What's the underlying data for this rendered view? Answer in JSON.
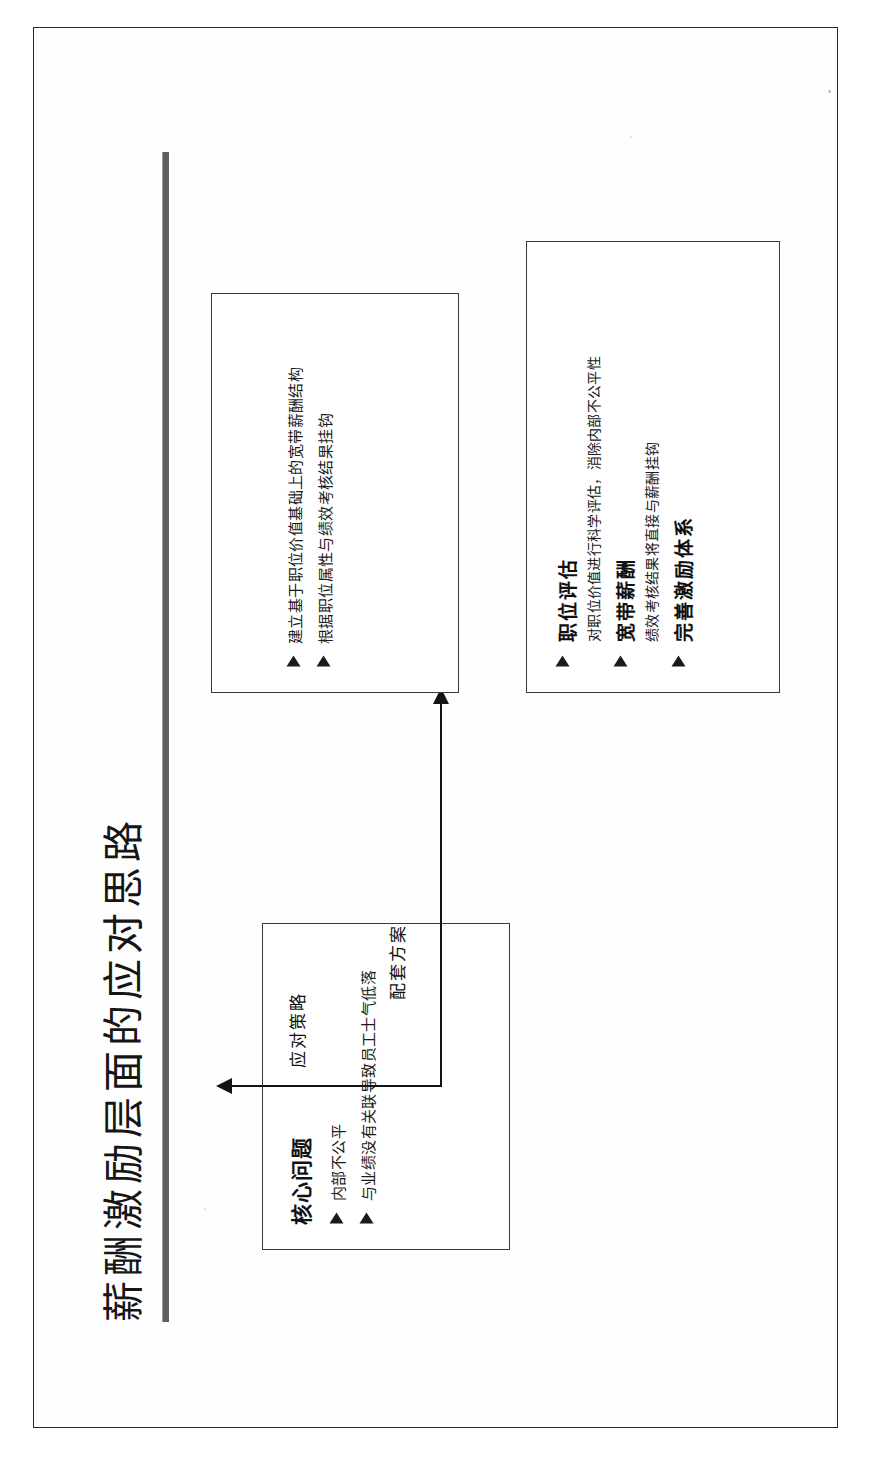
{
  "page": {
    "title": "薪酬激励层面的应对思路"
  },
  "problem_box": {
    "heading": "核心问题",
    "items": [
      "内部不公平",
      "与业绩没有关联导致员工士气低落"
    ]
  },
  "connectors": {
    "strategy_label": "应对策略",
    "package_label": "配套方案"
  },
  "strategy_box": {
    "items": [
      "建立基于职位价值基础上的宽带薪酬结构",
      "根据职位属性与绩效考核结果挂钩"
    ]
  },
  "package_box": {
    "items": [
      {
        "heading": "职位评估",
        "detail": "对职位价值进行科学评估，消除内部不公平性"
      },
      {
        "heading": "宽带薪酬",
        "detail": "绩效考核结果将直接与薪酬挂钩"
      },
      {
        "heading": "完善激励体系",
        "detail": ""
      }
    ]
  },
  "colors": {
    "page_border": "#2b2b2b",
    "box_border": "#3a3a3a",
    "rule": "#5f5f5f",
    "text": "#161616",
    "connector": "#141414"
  }
}
